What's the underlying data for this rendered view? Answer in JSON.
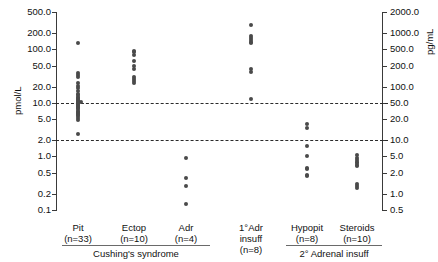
{
  "figure": {
    "left_axis_title": "pmol/L",
    "right_axis_title": "pg/mL",
    "left_ticks": [
      "500.0",
      "200.0",
      "100.0",
      "50.0",
      "20.0",
      "10.0",
      "5.0",
      "2.0",
      "1.0",
      "0.5",
      "0.2",
      "0.1"
    ],
    "right_ticks": [
      "2000.0",
      "1000.0",
      "500.0",
      "200.0",
      "100.0",
      "50.0",
      "20.0",
      "10.0",
      "5.0",
      "2.0",
      "1.0",
      "0.5"
    ],
    "reference_lines": [
      "10.0",
      "2.0"
    ],
    "group_brackets": [
      {
        "label": "Cushing's syndrome"
      },
      {
        "label": "2° Adrenal insuff"
      }
    ]
  },
  "chart_data": {
    "type": "scatter",
    "title": "",
    "xlabel": "",
    "ylabel": "pmol/L",
    "ylabel_secondary": "pg/mL",
    "yscale": "log",
    "ylim": [
      0.1,
      500.0
    ],
    "ylim_secondary": [
      0.5,
      2000.0
    ],
    "y_ticks": [
      500.0,
      200.0,
      100.0,
      50.0,
      20.0,
      10.0,
      5.0,
      2.0,
      1.0,
      0.5,
      0.2,
      0.1
    ],
    "y_ticks_secondary": [
      2000.0,
      1000.0,
      500.0,
      200.0,
      100.0,
      50.0,
      20.0,
      10.0,
      5.0,
      2.0,
      1.0,
      0.5
    ],
    "grid": false,
    "legend": "none",
    "unit_conversion": "1 pmol/L = 4.5 pg/mL",
    "reference_lines": [
      {
        "value": 10.0,
        "style": "dashed",
        "unit": "pmol/L"
      },
      {
        "value": 2.0,
        "style": "dashed",
        "unit": "pmol/L"
      }
    ],
    "categories": [
      {
        "name": "Pit",
        "n": 33,
        "label": "Pit",
        "n_label": "(n=33)",
        "group": "Cushing's syndrome",
        "values": [
          130.0,
          36.0,
          33.0,
          30.0,
          24.0,
          21.0,
          19.0,
          17.0,
          15.0,
          14.0,
          13.0,
          12.5,
          12.0,
          11.5,
          11.0,
          10.6,
          10.2,
          10.0,
          9.6,
          9.2,
          8.8,
          8.4,
          8.0,
          7.6,
          7.2,
          6.9,
          6.6,
          6.3,
          6.0,
          5.6,
          5.2,
          4.8,
          2.6
        ]
      },
      {
        "name": "Ectop",
        "n": 10,
        "label": "Ectop",
        "n_label": "(n=10)",
        "group": "Cushing's syndrome",
        "values": [
          95.0,
          88.0,
          80.0,
          62.0,
          48.0,
          44.0,
          30.0,
          28.0,
          26.0,
          24.0
        ]
      },
      {
        "name": "Adr",
        "n": 4,
        "label": "Adr",
        "n_label": "(n=4)",
        "group": "Cushing's syndrome",
        "values": [
          0.95,
          0.4,
          0.28,
          0.13
        ]
      },
      {
        "name": "1°Adr insuff",
        "n": 8,
        "label": "1°Adr\ninsuff",
        "n_label": "(n=8)",
        "group": "",
        "values": [
          280.0,
          180.0,
          160.0,
          150.0,
          140.0,
          130.0,
          44.0,
          38.0,
          12.0
        ]
      },
      {
        "name": "Hypopit",
        "n": 8,
        "label": "Hypopit",
        "n_label": "(n=8)",
        "group": "2° Adrenal insuff",
        "values": [
          4.0,
          3.4,
          1.6,
          1.0,
          0.62,
          0.58,
          0.46,
          0.44
        ]
      },
      {
        "name": "Steroids",
        "n": 10,
        "label": "Steroids",
        "n_label": "(n=10)",
        "group": "2° Adrenal insuff",
        "values": [
          1.05,
          0.95,
          0.86,
          0.8,
          0.74,
          0.7,
          0.66,
          0.3,
          0.28,
          0.26
        ]
      }
    ]
  }
}
